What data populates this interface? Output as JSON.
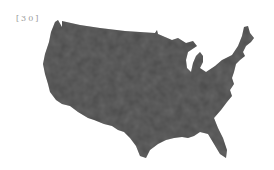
{
  "figure": {
    "label": "[30]",
    "fill_color": "#4a4a4a",
    "texture_color": "#575757",
    "background": "#ffffff"
  }
}
